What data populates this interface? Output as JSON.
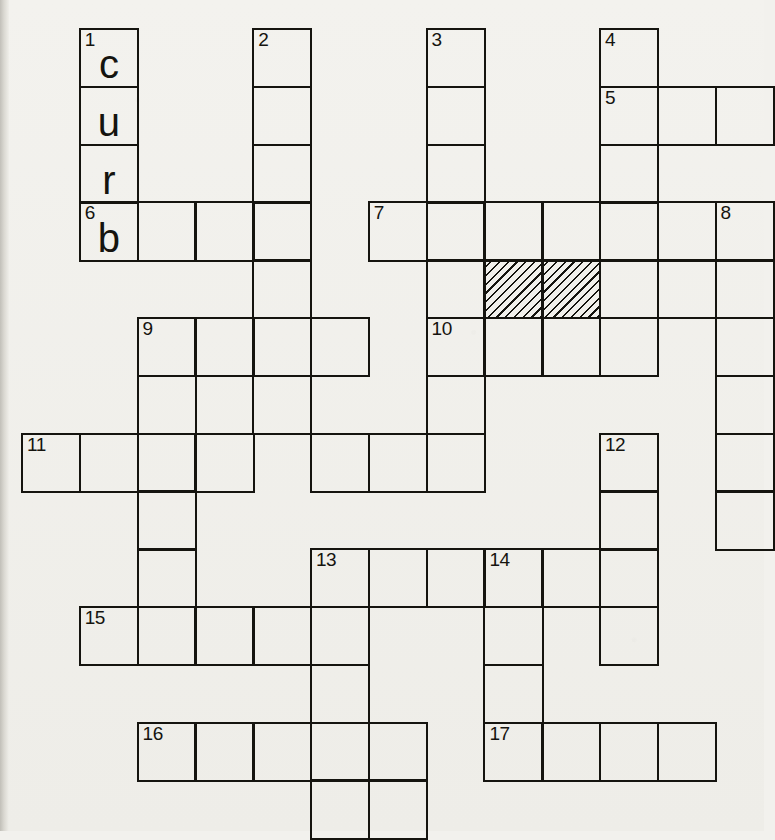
{
  "puzzle": {
    "title": "Crossword grid",
    "type": "crossword",
    "grid": {
      "origin_x": 21,
      "origin_y": 28,
      "cell": 57.8,
      "cols": 13,
      "rows": 14,
      "line_color": "#15140f",
      "paper_color": "#f2f1ed"
    },
    "entries": [
      {
        "number": "1",
        "direction": "down",
        "col": 1,
        "row": 0,
        "length": 4
      },
      {
        "number": "2",
        "direction": "down",
        "col": 4,
        "row": 0,
        "length": 7
      },
      {
        "number": "3",
        "direction": "down",
        "col": 7,
        "row": 0,
        "length": 4
      },
      {
        "number": "4",
        "direction": "down",
        "col": 10,
        "row": 0,
        "length": 4
      },
      {
        "number": "5",
        "direction": "across",
        "col": 10,
        "row": 1,
        "length": 3
      },
      {
        "number": "6",
        "direction": "across",
        "col": 1,
        "row": 3,
        "length": 4
      },
      {
        "number": "7",
        "direction": "across",
        "col": 6,
        "row": 3,
        "length": 7
      },
      {
        "number": "8",
        "direction": "down",
        "col": 12,
        "row": 3,
        "length": 6
      },
      {
        "number": "9",
        "direction": "across",
        "col": 2,
        "row": 5,
        "length": 4
      },
      {
        "number": "10",
        "direction": "across",
        "col": 7,
        "row": 5,
        "length": 4
      },
      {
        "number": "11",
        "direction": "across",
        "col": 0,
        "row": 7,
        "length": 8
      },
      {
        "number": "12",
        "direction": "down",
        "col": 10,
        "row": 7,
        "length": 4
      },
      {
        "number": "13",
        "direction": "down",
        "col": 5,
        "row": 9,
        "length": 5
      },
      {
        "number": "14",
        "direction": "across",
        "col": 8,
        "row": 9,
        "length": 3
      },
      {
        "number": "15",
        "direction": "across",
        "col": 1,
        "row": 10,
        "length": 5
      },
      {
        "number": "16",
        "direction": "across",
        "col": 2,
        "row": 12,
        "length": 5
      },
      {
        "number": "17",
        "direction": "across",
        "col": 8,
        "row": 12,
        "length": 4
      }
    ],
    "cells": [
      {
        "col": 1,
        "row": 0,
        "number": "1",
        "letter": "c"
      },
      {
        "col": 1,
        "row": 1,
        "number": "",
        "letter": "u"
      },
      {
        "col": 1,
        "row": 2,
        "number": "",
        "letter": "r"
      },
      {
        "col": 1,
        "row": 3,
        "number": "6",
        "letter": "b"
      },
      {
        "col": 2,
        "row": 3,
        "number": "",
        "letter": ""
      },
      {
        "col": 3,
        "row": 3,
        "number": "",
        "letter": ""
      },
      {
        "col": 4,
        "row": 3,
        "number": "",
        "letter": ""
      },
      {
        "col": 4,
        "row": 0,
        "number": "2",
        "letter": ""
      },
      {
        "col": 4,
        "row": 1,
        "number": "",
        "letter": ""
      },
      {
        "col": 4,
        "row": 2,
        "number": "",
        "letter": ""
      },
      {
        "col": 4,
        "row": 4,
        "number": "",
        "letter": ""
      },
      {
        "col": 4,
        "row": 5,
        "number": "",
        "letter": ""
      },
      {
        "col": 4,
        "row": 6,
        "number": "",
        "letter": ""
      },
      {
        "col": 7,
        "row": 0,
        "number": "3",
        "letter": ""
      },
      {
        "col": 7,
        "row": 1,
        "number": "",
        "letter": ""
      },
      {
        "col": 7,
        "row": 2,
        "number": "",
        "letter": ""
      },
      {
        "col": 10,
        "row": 0,
        "number": "4",
        "letter": ""
      },
      {
        "col": 10,
        "row": 1,
        "number": "5",
        "letter": ""
      },
      {
        "col": 11,
        "row": 1,
        "number": "",
        "letter": ""
      },
      {
        "col": 12,
        "row": 1,
        "number": "",
        "letter": ""
      },
      {
        "col": 10,
        "row": 2,
        "number": "",
        "letter": ""
      },
      {
        "col": 6,
        "row": 3,
        "number": "7",
        "letter": ""
      },
      {
        "col": 7,
        "row": 3,
        "number": "",
        "letter": ""
      },
      {
        "col": 8,
        "row": 3,
        "number": "",
        "letter": ""
      },
      {
        "col": 9,
        "row": 3,
        "number": "",
        "letter": ""
      },
      {
        "col": 10,
        "row": 3,
        "number": "",
        "letter": ""
      },
      {
        "col": 11,
        "row": 3,
        "number": "",
        "letter": ""
      },
      {
        "col": 12,
        "row": 3,
        "number": "8",
        "letter": ""
      },
      {
        "col": 7,
        "row": 4,
        "number": "",
        "letter": ""
      },
      {
        "col": 8,
        "row": 4,
        "number": "",
        "letter": "",
        "hatched": true
      },
      {
        "col": 9,
        "row": 4,
        "number": "",
        "letter": "",
        "hatched": true
      },
      {
        "col": 10,
        "row": 4,
        "number": "",
        "letter": ""
      },
      {
        "col": 11,
        "row": 4,
        "number": "",
        "letter": ""
      },
      {
        "col": 12,
        "row": 4,
        "number": "",
        "letter": ""
      },
      {
        "col": 2,
        "row": 5,
        "number": "9",
        "letter": ""
      },
      {
        "col": 3,
        "row": 5,
        "number": "",
        "letter": ""
      },
      {
        "col": 5,
        "row": 5,
        "number": "",
        "letter": ""
      },
      {
        "col": 7,
        "row": 5,
        "number": "10",
        "letter": ""
      },
      {
        "col": 8,
        "row": 5,
        "number": "",
        "letter": ""
      },
      {
        "col": 9,
        "row": 5,
        "number": "",
        "letter": ""
      },
      {
        "col": 10,
        "row": 5,
        "number": "",
        "letter": ""
      },
      {
        "col": 12,
        "row": 5,
        "number": "",
        "letter": ""
      },
      {
        "col": 2,
        "row": 6,
        "number": "",
        "letter": ""
      },
      {
        "col": 7,
        "row": 6,
        "number": "",
        "letter": ""
      },
      {
        "col": 12,
        "row": 6,
        "number": "",
        "letter": ""
      },
      {
        "col": 0,
        "row": 7,
        "number": "11",
        "letter": ""
      },
      {
        "col": 1,
        "row": 7,
        "number": "",
        "letter": ""
      },
      {
        "col": 2,
        "row": 7,
        "number": "",
        "letter": ""
      },
      {
        "col": 3,
        "row": 7,
        "number": "",
        "letter": ""
      },
      {
        "col": 5,
        "row": 7,
        "number": "",
        "letter": ""
      },
      {
        "col": 6,
        "row": 7,
        "number": "",
        "letter": ""
      },
      {
        "col": 7,
        "row": 7,
        "number": "",
        "letter": ""
      },
      {
        "col": 10,
        "row": 7,
        "number": "12",
        "letter": ""
      },
      {
        "col": 12,
        "row": 7,
        "number": "",
        "letter": ""
      },
      {
        "col": 2,
        "row": 8,
        "number": "",
        "letter": ""
      },
      {
        "col": 10,
        "row": 8,
        "number": "",
        "letter": ""
      },
      {
        "col": 12,
        "row": 8,
        "number": "",
        "letter": ""
      },
      {
        "col": 2,
        "row": 9,
        "number": "",
        "letter": ""
      },
      {
        "col": 5,
        "row": 9,
        "number": "13",
        "letter": ""
      },
      {
        "col": 6,
        "row": 9,
        "number": "",
        "letter": ""
      },
      {
        "col": 7,
        "row": 9,
        "number": "",
        "letter": ""
      },
      {
        "col": 8,
        "row": 9,
        "number": "14",
        "letter": ""
      },
      {
        "col": 9,
        "row": 9,
        "number": "",
        "letter": ""
      },
      {
        "col": 10,
        "row": 9,
        "number": "",
        "letter": ""
      },
      {
        "col": 1,
        "row": 10,
        "number": "15",
        "letter": ""
      },
      {
        "col": 2,
        "row": 10,
        "number": "",
        "letter": ""
      },
      {
        "col": 3,
        "row": 10,
        "number": "",
        "letter": ""
      },
      {
        "col": 4,
        "row": 10,
        "number": "",
        "letter": ""
      },
      {
        "col": 5,
        "row": 10,
        "number": "",
        "letter": ""
      },
      {
        "col": 8,
        "row": 10,
        "number": "",
        "letter": ""
      },
      {
        "col": 10,
        "row": 10,
        "number": "",
        "letter": ""
      },
      {
        "col": 5,
        "row": 11,
        "number": "",
        "letter": ""
      },
      {
        "col": 8,
        "row": 11,
        "number": "",
        "letter": ""
      },
      {
        "col": 2,
        "row": 12,
        "number": "16",
        "letter": ""
      },
      {
        "col": 3,
        "row": 12,
        "number": "",
        "letter": ""
      },
      {
        "col": 4,
        "row": 12,
        "number": "",
        "letter": ""
      },
      {
        "col": 5,
        "row": 12,
        "number": "",
        "letter": ""
      },
      {
        "col": 6,
        "row": 12,
        "number": "",
        "letter": ""
      },
      {
        "col": 8,
        "row": 12,
        "number": "17",
        "letter": ""
      },
      {
        "col": 9,
        "row": 12,
        "number": "",
        "letter": ""
      },
      {
        "col": 10,
        "row": 12,
        "number": "",
        "letter": ""
      },
      {
        "col": 11,
        "row": 12,
        "number": "",
        "letter": ""
      },
      {
        "col": 5,
        "row": 13,
        "number": "",
        "letter": ""
      },
      {
        "col": 6,
        "row": 13,
        "number": "",
        "letter": ""
      }
    ]
  }
}
